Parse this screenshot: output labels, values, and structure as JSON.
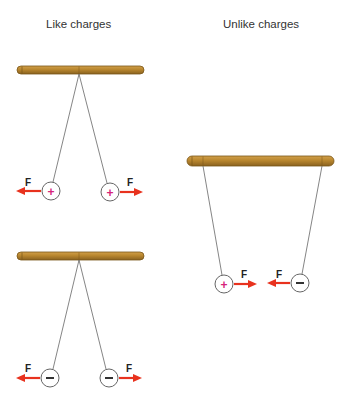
{
  "panels": {
    "like": {
      "title": "Like charges"
    },
    "unlike": {
      "title": "Unlike charges"
    }
  },
  "force_label": "F",
  "charges": {
    "positive": "+",
    "negative": "−"
  },
  "colors": {
    "rod": "#b8862e",
    "rod_dark": "#7a5618",
    "string": "#666666",
    "arrow": "#e8321e",
    "positive_sign": "#d6257a",
    "negative_sign": "#333333",
    "ball_outline": "#666666"
  },
  "diagrams": [
    {
      "id": "like-positive",
      "rod": "top-left",
      "charges": [
        "+",
        "+"
      ],
      "forces": [
        "left",
        "right"
      ],
      "interaction": "repel"
    },
    {
      "id": "like-negative",
      "rod": "bottom-left",
      "charges": [
        "−",
        "−"
      ],
      "forces": [
        "left",
        "right"
      ],
      "interaction": "repel"
    },
    {
      "id": "unlike",
      "rod": "right",
      "charges": [
        "+",
        "−"
      ],
      "forces": [
        "right",
        "left"
      ],
      "interaction": "attract"
    }
  ]
}
